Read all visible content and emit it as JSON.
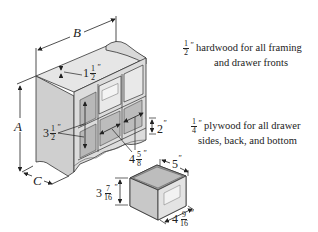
{
  "diagram": {
    "dimension_labels": {
      "A": "A",
      "B": "B",
      "C": "C",
      "top_lip": {
        "whole": "1",
        "num": "1",
        "den": "2",
        "unit": "\""
      },
      "cubby_height": {
        "whole": "3",
        "num": "1",
        "den": "2",
        "unit": "\""
      },
      "cubby_width": {
        "whole": "4",
        "num": "5",
        "den": "8",
        "unit": "\""
      },
      "base_height": {
        "whole": "2",
        "unit": "\""
      },
      "drawer_width": {
        "whole": "5",
        "unit": "\""
      },
      "drawer_height": {
        "whole": "3",
        "num": "7",
        "den": "16",
        "unit": "\""
      },
      "drawer_depth": {
        "whole": "4",
        "num": "9",
        "den": "16",
        "unit": "\""
      }
    },
    "notes": [
      {
        "frac_num": "1",
        "frac_den": "2",
        "unit": "\"",
        "line1": "hardwood for all framing",
        "line2": "and drawer fronts"
      },
      {
        "frac_num": "1",
        "frac_den": "4",
        "unit": "\"",
        "line1": "plywood for all drawer",
        "line2": "sides, back, and bottom"
      }
    ],
    "drawer_front_label": "Pasta"
  },
  "colors": {
    "wood_light": "#e4e4e4",
    "wood_mid": "#cfcfcf",
    "wood_dark": "#a9a9a9",
    "line": "#333333"
  }
}
